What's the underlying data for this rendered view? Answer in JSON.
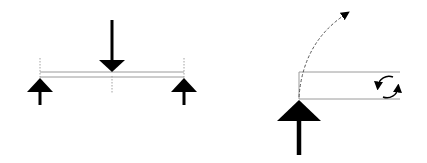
{
  "diagram": {
    "type": "structural-beam-diagrams",
    "colors": {
      "background": "#ffffff",
      "ink": "#000000",
      "beam_outline": "#9a9a9a",
      "guide_line": "#8a8a8a"
    },
    "panels": [
      {
        "name": "simply-supported-beam",
        "beam": {
          "x1": 40,
          "x2": 184,
          "y_top": 72,
          "y_bottom": 77
        },
        "supports": [
          {
            "name": "left-support-reaction",
            "x": 40,
            "apex_y": 78,
            "base_y": 92,
            "half_width": 13,
            "stem_end_y": 105
          },
          {
            "name": "right-support-reaction",
            "x": 184,
            "apex_y": 78,
            "base_y": 92,
            "half_width": 13,
            "stem_end_y": 105
          }
        ],
        "load": {
          "name": "center-point-load",
          "x": 112,
          "start_y": 20,
          "head_start_y": 60,
          "tip_y": 72,
          "half_width": 13
        },
        "guide_lines": [
          {
            "x": 40,
            "y1": 58,
            "y2": 78
          },
          {
            "x": 112,
            "y1": 76,
            "y2": 92
          },
          {
            "x": 184,
            "y1": 58,
            "y2": 78
          }
        ]
      },
      {
        "name": "cantilever-beam",
        "beam": {
          "x1": 299,
          "x2": 400,
          "y_top": 72,
          "y_bottom": 99
        },
        "support": {
          "name": "fixed-support-reaction",
          "x": 299,
          "apex_y": 100,
          "base_y": 121,
          "half_width": 22,
          "stem_end_y": 155
        },
        "deflection_curve": {
          "name": "rotation-path",
          "start": [
            299,
            97
          ],
          "control": [
            304,
            40
          ],
          "end": [
            346,
            14
          ]
        },
        "moment": {
          "name": "moment-rotation-arrows",
          "cx": 388,
          "cy": 87,
          "r": 11
        }
      }
    ]
  }
}
